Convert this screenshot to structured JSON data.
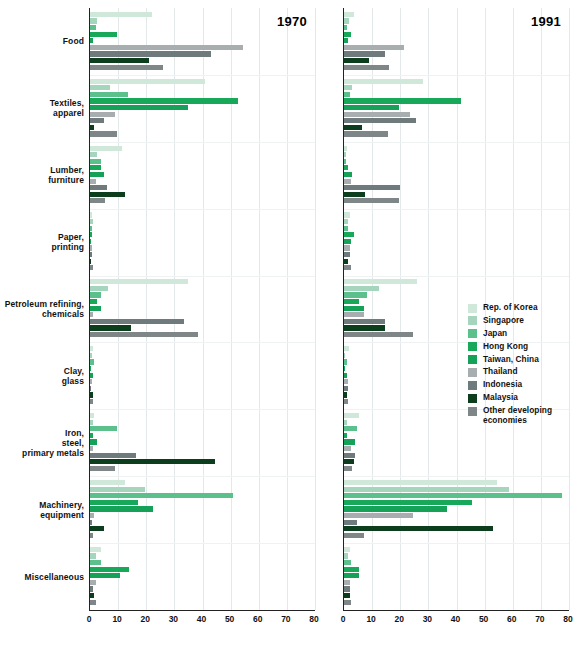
{
  "chart_data": {
    "type": "bar",
    "orientation": "horizontal",
    "title": "",
    "xlabel": "",
    "ylabel": "",
    "xlim": [
      0,
      80
    ],
    "xticks": [
      0,
      10,
      20,
      30,
      40,
      50,
      60,
      70,
      80
    ],
    "grid": true,
    "legend_position": "right-middle",
    "panels": [
      {
        "label": "1970"
      },
      {
        "label": "1991"
      }
    ],
    "categories": [
      "Food",
      "Textiles, apparel",
      "Lumber, furniture",
      "Paper, printing",
      "Petroleum refining, chemicals",
      "Clay, glass",
      "Iron, steel, primary metals",
      "Machinery, equipment",
      "Miscellaneous"
    ],
    "series": [
      {
        "name": "Rep. of Korea",
        "color": "#cfe8da",
        "values_1970": [
          22.0,
          41.0,
          11.5,
          0.8,
          35.0,
          1.0,
          1.5,
          12.5,
          4.0
        ],
        "values_1991": [
          3.5,
          28.0,
          1.0,
          2.0,
          26.0,
          1.8,
          5.5,
          54.5,
          2.0
        ]
      },
      {
        "name": "Singapore",
        "color": "#a5d5bd",
        "values_1970": [
          2.5,
          7.0,
          2.5,
          1.2,
          6.5,
          0.8,
          1.0,
          19.5,
          2.0
        ],
        "values_1991": [
          1.8,
          3.0,
          0.8,
          1.5,
          12.5,
          0.5,
          1.0,
          58.5,
          1.5
        ]
      },
      {
        "name": "Japan",
        "color": "#5cc08d",
        "values_1970": [
          2.0,
          13.5,
          4.0,
          0.6,
          4.0,
          1.5,
          9.5,
          51.0,
          4.0
        ],
        "values_1991": [
          1.2,
          2.0,
          0.8,
          1.5,
          8.0,
          1.0,
          4.5,
          77.5,
          2.5
        ]
      },
      {
        "name": "Hong Kong",
        "color": "#17a85a",
        "values_1970": [
          9.5,
          52.5,
          4.0,
          0.8,
          2.5,
          0.3,
          1.0,
          17.0,
          14.0
        ],
        "values_1991": [
          2.5,
          41.5,
          1.5,
          3.5,
          5.5,
          0.5,
          1.0,
          45.5,
          5.5
        ]
      },
      {
        "name": "Taiwan, China",
        "color": "#15a157",
        "values_1970": [
          1.0,
          35.0,
          5.0,
          0.5,
          4.0,
          1.0,
          2.5,
          22.5,
          10.5
        ],
        "values_1991": [
          1.5,
          19.5,
          3.0,
          2.5,
          7.0,
          1.0,
          4.0,
          36.5,
          5.5
        ]
      },
      {
        "name": "Thailand",
        "color": "#a8adb0",
        "values_1970": [
          54.5,
          9.0,
          2.0,
          0.6,
          1.0,
          0.6,
          1.0,
          1.5,
          2.0
        ],
        "values_1991": [
          21.5,
          23.5,
          2.5,
          2.0,
          7.0,
          1.5,
          2.5,
          24.5,
          2.0
        ]
      },
      {
        "name": "Indonesia",
        "color": "#6f7a7d",
        "values_1970": [
          43.0,
          5.0,
          6.0,
          0.8,
          33.5,
          0.5,
          16.5,
          0.8,
          1.0
        ],
        "values_1991": [
          14.5,
          25.5,
          20.0,
          2.0,
          14.5,
          1.5,
          4.0,
          4.5,
          2.0
        ]
      },
      {
        "name": "Malaysia",
        "color": "#0c3d1d",
        "values_1970": [
          21.0,
          1.5,
          12.5,
          0.5,
          14.5,
          1.0,
          44.5,
          5.0,
          1.5
        ],
        "values_1991": [
          9.0,
          6.5,
          7.5,
          1.5,
          14.5,
          1.0,
          3.5,
          53.0,
          2.0
        ]
      },
      {
        "name": "Other developing economies",
        "color": "#7f8688",
        "values_1970": [
          26.0,
          9.5,
          5.5,
          1.0,
          38.5,
          1.0,
          9.0,
          1.0,
          2.0
        ],
        "values_1991": [
          16.0,
          15.5,
          19.5,
          2.5,
          24.5,
          1.5,
          3.0,
          7.0,
          2.5
        ]
      }
    ]
  },
  "legend": {
    "items": [
      {
        "label": "Rep. of Korea",
        "color": "#cfe8da"
      },
      {
        "label": "Singapore",
        "color": "#a5d5bd"
      },
      {
        "label": "Japan",
        "color": "#5cc08d"
      },
      {
        "label": "Hong Kong",
        "color": "#17a85a"
      },
      {
        "label": "Taiwan, China",
        "color": "#15a157"
      },
      {
        "label": "Thailand",
        "color": "#a8adb0"
      },
      {
        "label": "Indonesia",
        "color": "#6f7a7d"
      },
      {
        "label": "Malaysia",
        "color": "#0c3d1d"
      },
      {
        "label": "Other developing economies",
        "color": "#7f8688"
      }
    ]
  },
  "caption": ""
}
